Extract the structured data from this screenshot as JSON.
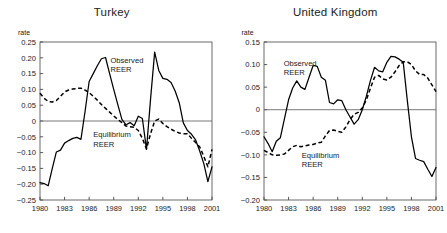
{
  "figure": {
    "axis_label": "rate",
    "panels": [
      "turkey",
      "uk"
    ]
  },
  "chart_data": [
    {
      "id": "turkey",
      "type": "line",
      "title": "Turkey",
      "xlabel": "",
      "ylabel": "rate",
      "grid": false,
      "legend_position": "inline-annotation",
      "xlim": [
        1980,
        2001
      ],
      "ylim": [
        -0.25,
        0.25
      ],
      "xticks": [
        1980,
        1983,
        1986,
        1989,
        1992,
        1995,
        1998,
        2001
      ],
      "xticklabels": [
        "1980",
        "1983",
        "1986",
        "1989",
        "1992",
        "1995",
        "1998",
        "2001"
      ],
      "yticks": [
        0.25,
        0.2,
        0.15,
        0.1,
        0.05,
        0,
        -0.05,
        -0.1,
        -0.15,
        -0.2,
        -0.25
      ],
      "yticklabels": [
        "0.25",
        "0.20",
        "0.15",
        "0.10",
        "0.05",
        "0",
        "-0.05",
        "-0.10",
        "-0.15",
        "-0.20",
        "-0.25"
      ],
      "annotations": [
        {
          "text": "Observed REER",
          "lines": [
            "Observed",
            "REER"
          ],
          "x": 1988.6,
          "y": 0.185
        },
        {
          "text": "Equilibrium REER",
          "lines": [
            "Equilibrium",
            "REER"
          ],
          "x": 1986.5,
          "y": -0.052
        }
      ],
      "x": [
        1980,
        1980.5,
        1981,
        1981.5,
        1982,
        1982.5,
        1983,
        1983.5,
        1984,
        1984.5,
        1985,
        1985.5,
        1986,
        1986.5,
        1987,
        1987.5,
        1988,
        1988.5,
        1989,
        1989.5,
        1990,
        1990.5,
        1991,
        1991.5,
        1992,
        1992.5,
        1993,
        1993.5,
        1994,
        1994.5,
        1995,
        1995.5,
        1996,
        1996.5,
        1997,
        1997.5,
        1998,
        1998.5,
        1999,
        1999.5,
        2000,
        2000.5,
        2001
      ],
      "series": [
        {
          "name": "Observed REER",
          "style": "solid",
          "values": [
            -0.195,
            -0.198,
            -0.205,
            -0.15,
            -0.098,
            -0.092,
            -0.07,
            -0.062,
            -0.055,
            -0.052,
            -0.058,
            0.03,
            0.125,
            0.15,
            0.175,
            0.197,
            0.201,
            0.15,
            0.1,
            0.052,
            0.005,
            -0.012,
            -0.005,
            -0.015,
            0.015,
            0.008,
            -0.09,
            0.07,
            0.218,
            0.16,
            0.135,
            0.132,
            0.122,
            0.095,
            0.058,
            -0.006,
            -0.03,
            -0.042,
            -0.06,
            -0.095,
            -0.135,
            -0.192,
            -0.145
          ]
        },
        {
          "name": "Equilibrium REER",
          "style": "dashed",
          "values": [
            0.088,
            0.072,
            0.062,
            0.06,
            0.065,
            0.078,
            0.092,
            0.098,
            0.101,
            0.103,
            0.104,
            0.098,
            0.09,
            0.078,
            0.066,
            0.052,
            0.04,
            0.028,
            0.016,
            0.005,
            -0.005,
            -0.016,
            -0.018,
            -0.02,
            -0.03,
            -0.055,
            -0.088,
            -0.04,
            0.0,
            0.006,
            -0.008,
            -0.018,
            -0.026,
            -0.033,
            -0.038,
            -0.04,
            -0.04,
            -0.055,
            -0.068,
            -0.082,
            -0.112,
            -0.145,
            -0.09
          ]
        }
      ]
    },
    {
      "id": "uk",
      "type": "line",
      "title": "United Kingdom",
      "xlabel": "",
      "ylabel": "rate",
      "grid": false,
      "legend_position": "inline-annotation",
      "xlim": [
        1980,
        2001
      ],
      "ylim": [
        -0.2,
        0.15
      ],
      "xticks": [
        1980,
        1983,
        1986,
        1989,
        1992,
        1995,
        1998,
        2001
      ],
      "xticklabels": [
        "1980",
        "1983",
        "1986",
        "1989",
        "1992",
        "1995",
        "1998",
        "2001"
      ],
      "yticks": [
        0.15,
        0.1,
        0.05,
        0,
        -0.05,
        -0.1,
        -0.15,
        -0.2
      ],
      "yticklabels": [
        "0.15",
        "0.10",
        "0.05",
        "0",
        "-0.05",
        "-0.10",
        "-0.15",
        "-0.20"
      ],
      "annotations": [
        {
          "text": "Observed REER",
          "lines": [
            "Observed",
            "REER"
          ],
          "x": 1982.4,
          "y": 0.097
        },
        {
          "text": "Equilibrium REER",
          "lines": [
            "Equilibrium",
            "REER"
          ],
          "x": 1984.6,
          "y": -0.107
        }
      ],
      "x": [
        1980,
        1980.5,
        1981,
        1981.5,
        1982,
        1982.5,
        1983,
        1983.5,
        1984,
        1984.5,
        1985,
        1985.5,
        1986,
        1986.5,
        1987,
        1987.5,
        1988,
        1988.5,
        1989,
        1989.5,
        1990,
        1990.5,
        1991,
        1991.5,
        1992,
        1992.5,
        1993,
        1993.5,
        1994,
        1994.5,
        1995,
        1995.5,
        1996,
        1996.5,
        1997,
        1997.5,
        1998,
        1998.5,
        1999,
        1999.5,
        2000,
        2000.5,
        2001
      ],
      "series": [
        {
          "name": "Observed REER",
          "style": "solid",
          "values": [
            -0.06,
            -0.075,
            -0.093,
            -0.07,
            -0.062,
            -0.02,
            0.022,
            0.048,
            0.064,
            0.05,
            0.045,
            0.072,
            0.098,
            0.096,
            0.072,
            0.065,
            0.016,
            0.013,
            0.022,
            0.02,
            0.0,
            -0.016,
            -0.032,
            -0.022,
            0.0,
            0.03,
            0.065,
            0.094,
            0.086,
            0.084,
            0.105,
            0.118,
            0.117,
            0.112,
            0.105,
            0.02,
            -0.06,
            -0.108,
            -0.112,
            -0.115,
            -0.132,
            -0.148,
            -0.128
          ]
        },
        {
          "name": "Equilibrium REER",
          "style": "dashed",
          "values": [
            -0.09,
            -0.095,
            -0.1,
            -0.101,
            -0.1,
            -0.098,
            -0.09,
            -0.082,
            -0.079,
            -0.082,
            -0.08,
            -0.078,
            -0.077,
            -0.074,
            -0.072,
            -0.058,
            -0.046,
            -0.045,
            -0.048,
            -0.05,
            -0.038,
            -0.022,
            -0.01,
            -0.006,
            0.004,
            0.022,
            0.048,
            0.072,
            0.076,
            0.068,
            0.066,
            0.072,
            0.084,
            0.098,
            0.106,
            0.106,
            0.1,
            0.086,
            0.078,
            0.078,
            0.07,
            0.055,
            0.04
          ]
        }
      ]
    }
  ]
}
